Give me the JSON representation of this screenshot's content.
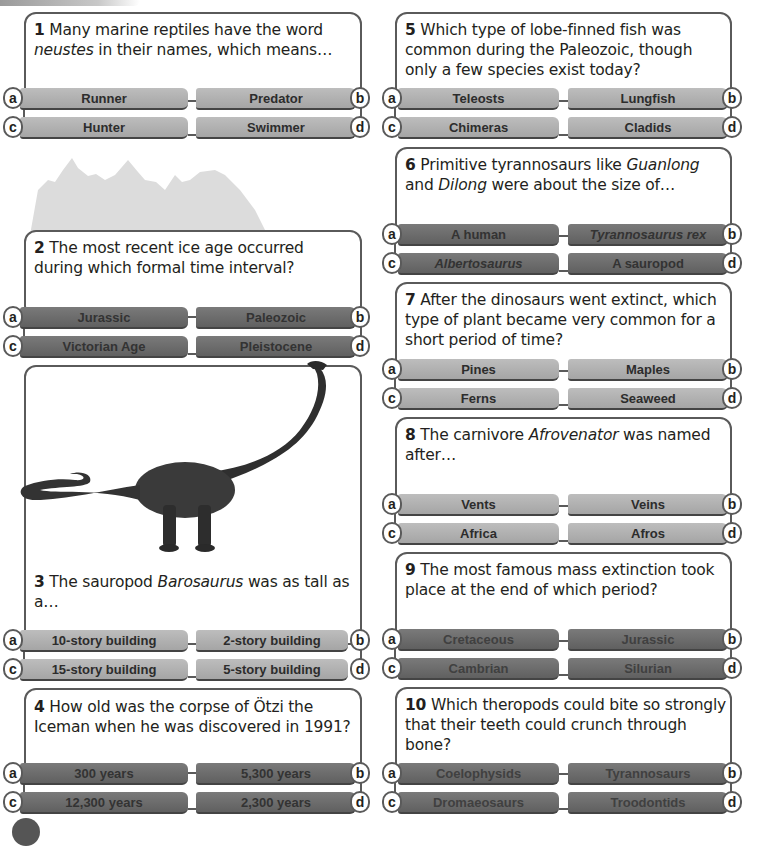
{
  "questions": [
    {
      "number": "1",
      "text_parts": [
        "Many marine reptiles have the word ",
        "neustes",
        " in their names, which means…"
      ],
      "style": "light",
      "answers": [
        {
          "letter": "a",
          "label": "Runner"
        },
        {
          "letter": "b",
          "label": "Predator"
        },
        {
          "letter": "c",
          "label": "Hunter"
        },
        {
          "letter": "d",
          "label": "Swimmer"
        }
      ]
    },
    {
      "number": "2",
      "text_parts": [
        "The most recent ice age occurred during which formal time interval?"
      ],
      "style": "dark",
      "answers": [
        {
          "letter": "a",
          "label": "Jurassic"
        },
        {
          "letter": "b",
          "label": "Paleozoic"
        },
        {
          "letter": "c",
          "label": "Victorian Age"
        },
        {
          "letter": "d",
          "label": "Pleistocene"
        }
      ]
    },
    {
      "number": "3",
      "text_parts": [
        "The sauropod ",
        "Barosaurus",
        " was as tall as a…"
      ],
      "style": "light",
      "answers": [
        {
          "letter": "a",
          "label": "10-story building"
        },
        {
          "letter": "b",
          "label": "2-story building"
        },
        {
          "letter": "c",
          "label": "15-story building"
        },
        {
          "letter": "d",
          "label": "5-story building"
        }
      ]
    },
    {
      "number": "4",
      "text_parts": [
        "How old was the corpse of Ötzi the Iceman when he was discovered in 1991?"
      ],
      "style": "dark",
      "answers": [
        {
          "letter": "a",
          "label": "300 years"
        },
        {
          "letter": "b",
          "label": "5,300 years"
        },
        {
          "letter": "c",
          "label": "12,300 years"
        },
        {
          "letter": "d",
          "label": "2,300 years"
        }
      ]
    },
    {
      "number": "5",
      "text_parts": [
        "Which type of lobe-finned fish was common during the Paleozoic, though only a few species exist today?"
      ],
      "style": "light",
      "answers": [
        {
          "letter": "a",
          "label": "Teleosts"
        },
        {
          "letter": "b",
          "label": "Lungfish"
        },
        {
          "letter": "c",
          "label": "Chimeras"
        },
        {
          "letter": "d",
          "label": "Cladids"
        }
      ]
    },
    {
      "number": "6",
      "text_parts": [
        "Primitive tyrannosaurs like ",
        "Guanlong",
        " and ",
        "Dilong",
        " were about the size of…"
      ],
      "style": "dark",
      "answers": [
        {
          "letter": "a",
          "label": "A human"
        },
        {
          "letter": "b",
          "label": "Tyrannosaurus rex"
        },
        {
          "letter": "c",
          "label": "Albertosaurus"
        },
        {
          "letter": "d",
          "label": "A sauropod"
        }
      ]
    },
    {
      "number": "7",
      "text_parts": [
        "After the dinosaurs went extinct, which type of plant became very common for a short period of time?"
      ],
      "style": "light",
      "answers": [
        {
          "letter": "a",
          "label": "Pines"
        },
        {
          "letter": "b",
          "label": "Maples"
        },
        {
          "letter": "c",
          "label": "Ferns"
        },
        {
          "letter": "d",
          "label": "Seaweed"
        }
      ]
    },
    {
      "number": "8",
      "text_parts": [
        "The carnivore ",
        "Afrovenator",
        " was named after…"
      ],
      "style": "light",
      "answers": [
        {
          "letter": "a",
          "label": "Vents"
        },
        {
          "letter": "b",
          "label": "Veins"
        },
        {
          "letter": "c",
          "label": "Africa"
        },
        {
          "letter": "d",
          "label": "Afros"
        }
      ]
    },
    {
      "number": "9",
      "text_parts": [
        "The most famous mass extinction took place at the end of which period?"
      ],
      "style": "dark",
      "answers": [
        {
          "letter": "a",
          "label": "Cretaceous"
        },
        {
          "letter": "b",
          "label": "Jurassic"
        },
        {
          "letter": "c",
          "label": "Cambrian"
        },
        {
          "letter": "d",
          "label": "Silurian"
        }
      ]
    },
    {
      "number": "10",
      "text_parts": [
        "Which theropods could bite so strongly that their teeth could crunch through bone?"
      ],
      "style": "dark",
      "answers": [
        {
          "letter": "a",
          "label": "Coelophysids"
        },
        {
          "letter": "b",
          "label": "Tyrannosaurs"
        },
        {
          "letter": "c",
          "label": "Dromaeosaurs"
        },
        {
          "letter": "d",
          "label": "Troodontids"
        }
      ]
    }
  ],
  "colors": {
    "light_bar": "#b1b1b1",
    "dark_bar": "#6b6b6b",
    "border": "#5a5a5a",
    "mountain": "#dcdcdc"
  }
}
